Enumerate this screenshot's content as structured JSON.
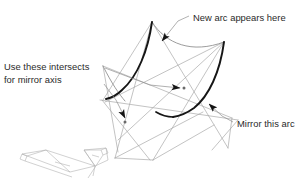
{
  "diagram": {
    "background_color": "#ffffff",
    "colors": {
      "thick_arc": "#161616",
      "thin_arc": "#8c8c8c",
      "construction_line": "#a0a0a0",
      "leader_line": "#8f8f8f",
      "arrowhead": "#141414",
      "text": "#2a2a2a",
      "wireframe": "#b0b0b0"
    },
    "annotations": [
      {
        "id": "new-arc-label",
        "text": "New arc appears here",
        "x": 193,
        "y": 18,
        "anchor": "start"
      },
      {
        "id": "mirror-axis-label-line1",
        "text": "Use these intersects",
        "x": 4,
        "y": 66,
        "anchor": "start"
      },
      {
        "id": "mirror-axis-label-line2",
        "text": "for mirror axis",
        "x": 4,
        "y": 78,
        "anchor": "start"
      },
      {
        "id": "mirror-arc-label",
        "text": "Mirror this arc",
        "x": 237,
        "y": 124,
        "anchor": "start"
      }
    ],
    "intersection_points": [
      {
        "id": "upper-intersect",
        "x": 184,
        "y": 88
      },
      {
        "id": "lower-intersect",
        "x": 125,
        "y": 122
      }
    ],
    "arcs": [
      {
        "id": "new-arc-left",
        "role": "new arc",
        "weight": "thick"
      },
      {
        "id": "mirror-arc-right",
        "role": "mirror this arc",
        "weight": "thick"
      },
      {
        "id": "guide-arc-upper",
        "role": "upper guide arc",
        "weight": "thin"
      },
      {
        "id": "guide-arc-lower",
        "role": "lower guide arc",
        "weight": "thin"
      }
    ],
    "inset": {
      "id": "folded-panel-wireframe",
      "description": "3D wireframe of folded V panel",
      "x": 16,
      "y": 146,
      "width": 92,
      "height": 31
    }
  }
}
